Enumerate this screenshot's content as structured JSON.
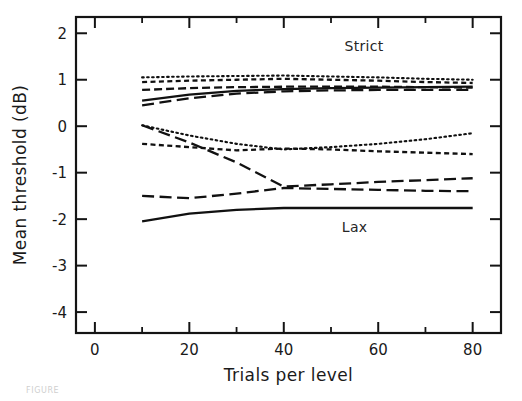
{
  "chart_data": {
    "type": "line",
    "title": "",
    "xlabel": "Trials per level",
    "ylabel": "Mean threshold (dB)",
    "xlim": [
      -4,
      86
    ],
    "ylim": [
      -4.45,
      2.35
    ],
    "xticks": [
      0,
      20,
      40,
      60,
      80
    ],
    "xtick_labels": [
      "0",
      "20",
      "40",
      "60",
      "80"
    ],
    "yticks": [
      2,
      1,
      0,
      -1,
      -2,
      -3,
      -4
    ],
    "ytick_labels": [
      "2",
      "1",
      "0",
      "-1",
      "-2",
      "-3",
      "-4"
    ],
    "grid": false,
    "legend": "none",
    "annotations": [
      {
        "text": "Strict",
        "x": 57,
        "y": 1.62
      },
      {
        "text": "Lax",
        "x": 55,
        "y": -2.28
      }
    ],
    "x": [
      10,
      20,
      30,
      40,
      50,
      60,
      70,
      80
    ],
    "series": [
      {
        "name": "strict-dotted",
        "style": "dotted",
        "values": [
          1.05,
          1.07,
          1.08,
          1.09,
          1.07,
          1.05,
          1.02,
          1.0
        ]
      },
      {
        "name": "strict-short-dash",
        "style": "short-dash",
        "values": [
          0.95,
          0.98,
          1.0,
          1.02,
          1.0,
          0.98,
          0.95,
          0.93
        ]
      },
      {
        "name": "strict-solid",
        "style": "solid",
        "values": [
          0.55,
          0.68,
          0.76,
          0.8,
          0.82,
          0.83,
          0.84,
          0.85
        ]
      },
      {
        "name": "strict-medium-dash",
        "style": "medium-dash",
        "values": [
          0.78,
          0.82,
          0.84,
          0.85,
          0.85,
          0.85,
          0.84,
          0.83
        ]
      },
      {
        "name": "strict-long-dash",
        "style": "long-dash",
        "values": [
          0.45,
          0.6,
          0.7,
          0.75,
          0.77,
          0.78,
          0.78,
          0.78
        ]
      },
      {
        "name": "mid-dotted",
        "style": "dotted",
        "values": [
          0.02,
          -0.2,
          -0.38,
          -0.5,
          -0.45,
          -0.38,
          -0.28,
          -0.15
        ]
      },
      {
        "name": "mid-short-dash",
        "style": "short-dash",
        "values": [
          -0.38,
          -0.45,
          -0.52,
          -0.48,
          -0.5,
          -0.54,
          -0.57,
          -0.6
        ]
      },
      {
        "name": "mid-long-dash",
        "style": "long-dash",
        "values": [
          0.02,
          -0.35,
          -0.78,
          -1.3,
          -1.25,
          -1.2,
          -1.16,
          -1.12
        ]
      },
      {
        "name": "lax-long-dash",
        "style": "long-dash",
        "values": [
          -1.5,
          -1.55,
          -1.45,
          -1.33,
          -1.35,
          -1.37,
          -1.39,
          -1.4
        ]
      },
      {
        "name": "lax-solid",
        "style": "solid",
        "values": [
          -2.05,
          -1.88,
          -1.8,
          -1.76,
          -1.76,
          -1.76,
          -1.76,
          -1.76
        ]
      }
    ]
  },
  "caption": {
    "ghost_text": "FIGURE"
  }
}
